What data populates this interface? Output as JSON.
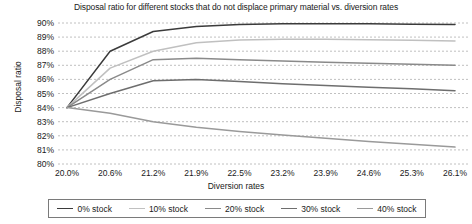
{
  "chart_data": {
    "type": "line",
    "title": "Disposal ratio for different stocks that do not displace primary material vs. diversion rates",
    "xlabel": "Diversion rates",
    "ylabel": "Disposal ratio",
    "categories": [
      "20.0%",
      "20.6%",
      "21.2%",
      "21.9%",
      "22.5%",
      "23.2%",
      "23.9%",
      "24.6%",
      "25.3%",
      "26.1%"
    ],
    "x_tick_labels": [
      "20.0%",
      "20.6%",
      "21.2%",
      "21.9%",
      "22.5%",
      "23.2%",
      "23.9%",
      "24.6%",
      "25.3%",
      "26.1%"
    ],
    "y_tick_labels": [
      "90%",
      "89%",
      "88%",
      "87%",
      "86%",
      "85%",
      "84%",
      "83%",
      "82%",
      "81%",
      "80%"
    ],
    "ylim": [
      80,
      90
    ],
    "y_ticks": [
      80,
      81,
      82,
      83,
      84,
      85,
      86,
      87,
      88,
      89,
      90
    ],
    "grid": "horizontal-dashed",
    "legend_position": "bottom",
    "series": [
      {
        "name": "0% stock",
        "color": "#3b3b3b",
        "values": [
          84.0,
          88.0,
          89.4,
          89.75,
          89.9,
          89.95,
          89.95,
          89.95,
          89.92,
          89.9
        ]
      },
      {
        "name": "10% stock",
        "color": "#c0c0c0",
        "values": [
          84.0,
          86.8,
          88.0,
          88.6,
          88.8,
          88.85,
          88.85,
          88.82,
          88.78,
          88.72
        ]
      },
      {
        "name": "20% stock",
        "color": "#8a8a8a",
        "values": [
          84.0,
          86.0,
          87.4,
          87.5,
          87.4,
          87.3,
          87.22,
          87.15,
          87.08,
          87.0
        ]
      },
      {
        "name": "30% stock",
        "color": "#6e6e6e",
        "values": [
          84.0,
          85.0,
          85.9,
          86.0,
          85.85,
          85.7,
          85.57,
          85.45,
          85.33,
          85.2
        ]
      },
      {
        "name": "40% stock",
        "color": "#9a9a9a",
        "values": [
          84.0,
          83.6,
          83.0,
          82.6,
          82.3,
          82.05,
          81.82,
          81.6,
          81.4,
          81.2
        ]
      }
    ]
  },
  "legend": {
    "items": [
      {
        "label": "0% stock"
      },
      {
        "label": "10% stock"
      },
      {
        "label": "20% stock"
      },
      {
        "label": "30% stock"
      },
      {
        "label": "40% stock"
      }
    ]
  }
}
